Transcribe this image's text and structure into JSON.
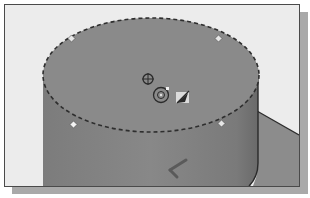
{
  "viewport": {
    "label": "3D modeling viewport",
    "background_color": "#ececec",
    "frame_color": "#4a4a4a",
    "shadow_color": "#a9a9a9"
  },
  "model": {
    "type": "cylinder",
    "body_color": "#858585",
    "top_face_color": "#8a8a8a",
    "floor_color": "#8c8c8c",
    "selection": "top-face-selected-dashed-outline",
    "grip_points": 4
  },
  "markers": {
    "center_point": "origin-crosshair-icon",
    "reference_point": "circular-target-icon",
    "direction_handle": "drag-arrow-handle-icon",
    "coordinate_indicator": "triad-axis-icon"
  }
}
